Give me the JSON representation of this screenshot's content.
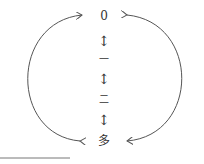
{
  "diagram": {
    "nodes": [
      {
        "id": "zero",
        "label": "0"
      },
      {
        "id": "one",
        "label": "一"
      },
      {
        "id": "two",
        "label": "二"
      },
      {
        "id": "many",
        "label": "多"
      }
    ],
    "connectors": [
      "↕",
      "↕",
      "↕"
    ],
    "edges": [
      {
        "from": "many",
        "to": "zero",
        "side": "left",
        "bidirectional": true
      },
      {
        "from": "zero",
        "to": "many",
        "side": "right",
        "bidirectional": true
      }
    ],
    "colors": {
      "stroke": "#555555",
      "text": "#333333"
    }
  }
}
